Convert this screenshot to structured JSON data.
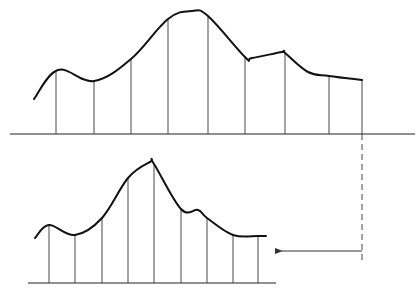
{
  "diagram": {
    "colors": {
      "ink": "#111111",
      "background": "#ffffff"
    },
    "top_graph": {
      "baseline": {
        "x1": 10,
        "x2": 415,
        "y": 134
      },
      "curve_points": [
        [
          34,
          99
        ],
        [
          58,
          70
        ],
        [
          94,
          81
        ],
        [
          131,
          59
        ],
        [
          168,
          19
        ],
        [
          192,
          11
        ],
        [
          208,
          16
        ],
        [
          245,
          57
        ],
        [
          252,
          58
        ],
        [
          282,
          52
        ],
        [
          285,
          53
        ],
        [
          308,
          72
        ],
        [
          329,
          76
        ],
        [
          362,
          80
        ]
      ],
      "ordinates_x": [
        56,
        94,
        131,
        168,
        208,
        245,
        285,
        329,
        362
      ],
      "ordinate_tops_y": [
        70,
        81,
        59,
        19,
        16,
        57,
        53,
        76,
        80
      ]
    },
    "bottom_graph": {
      "baseline": {
        "x1": 28,
        "x2": 276,
        "y": 283
      },
      "curve_points": [
        [
          35,
          238
        ],
        [
          49,
          225
        ],
        [
          75,
          235
        ],
        [
          102,
          218
        ],
        [
          128,
          178
        ],
        [
          150,
          162
        ],
        [
          154,
          164
        ],
        [
          181,
          209
        ],
        [
          198,
          210
        ],
        [
          207,
          218
        ],
        [
          233,
          235
        ],
        [
          258,
          236
        ],
        [
          266,
          236
        ]
      ],
      "ordinates_x": [
        49,
        75,
        102,
        128,
        154,
        181,
        207,
        233,
        258
      ],
      "ordinate_tops_y": [
        225,
        235,
        218,
        178,
        164,
        209,
        218,
        235,
        236
      ]
    },
    "connector": {
      "dashed_line": {
        "x": 362,
        "y1": 134,
        "y2": 262
      },
      "arrow": {
        "from_x": 362,
        "to_x": 276,
        "y": 251,
        "direction": "left"
      }
    }
  }
}
